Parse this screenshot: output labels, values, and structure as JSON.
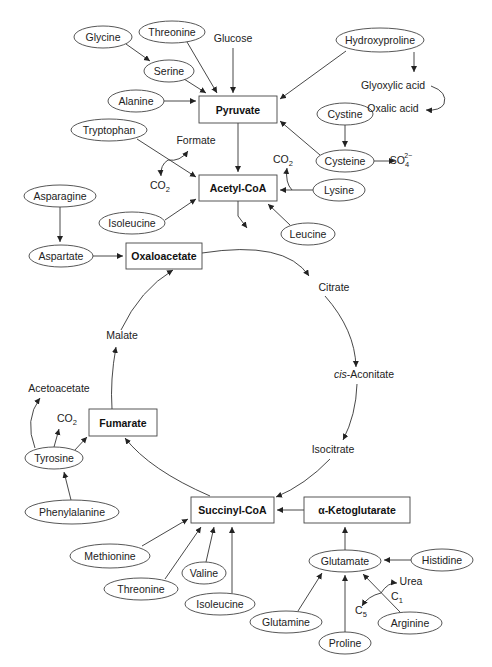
{
  "boxes": [
    {
      "id": "pyruvate",
      "label": "Pyruvate",
      "x": 199,
      "y": 96,
      "w": 78,
      "h": 27
    },
    {
      "id": "acetylcoa",
      "label": "Acetyl-CoA",
      "x": 199,
      "y": 175,
      "w": 78,
      "h": 26
    },
    {
      "id": "oxaloacetate",
      "label": "Oxaloacetate",
      "x": 126,
      "y": 243,
      "w": 76,
      "h": 26
    },
    {
      "id": "fumarate",
      "label": "Fumarate",
      "x": 89,
      "y": 409,
      "w": 68,
      "h": 27
    },
    {
      "id": "succinylcoa",
      "label": "Succinyl-CoA",
      "x": 191,
      "y": 497,
      "w": 83,
      "h": 26
    },
    {
      "id": "akg",
      "label": "α-Ketoglutarate",
      "x": 304,
      "y": 497,
      "w": 106,
      "h": 26
    }
  ],
  "ellipses": [
    {
      "id": "glycine",
      "label": "Glycine",
      "cx": 103,
      "cy": 37,
      "rx": 29,
      "ry": 11
    },
    {
      "id": "threonine-top",
      "label": "Threonine",
      "cx": 172,
      "cy": 32,
      "rx": 33,
      "ry": 11
    },
    {
      "id": "serine",
      "label": "Serine",
      "cx": 169,
      "cy": 71,
      "rx": 25,
      "ry": 11
    },
    {
      "id": "alanine",
      "label": "Alanine",
      "cx": 136,
      "cy": 101,
      "rx": 28,
      "ry": 11
    },
    {
      "id": "hydroxyproline",
      "label": "Hydroxyproline",
      "cx": 380,
      "cy": 40,
      "rx": 44,
      "ry": 12
    },
    {
      "id": "tryptophan",
      "label": "Tryptophan",
      "cx": 109,
      "cy": 130,
      "rx": 38,
      "ry": 11
    },
    {
      "id": "cystine",
      "label": "Cystine",
      "cx": 345,
      "cy": 114,
      "rx": 28,
      "ry": 11
    },
    {
      "id": "cysteine",
      "label": "Cysteine",
      "cx": 345,
      "cy": 161,
      "rx": 29,
      "ry": 11
    },
    {
      "id": "lysine",
      "label": "Lysine",
      "cx": 339,
      "cy": 190,
      "rx": 26,
      "ry": 11
    },
    {
      "id": "asparagine",
      "label": "Asparagine",
      "cx": 60,
      "cy": 196,
      "rx": 36,
      "ry": 11
    },
    {
      "id": "isoleucine-top",
      "label": "Isoleucine",
      "cx": 132,
      "cy": 223,
      "rx": 33,
      "ry": 11
    },
    {
      "id": "leucine",
      "label": "Leucine",
      "cx": 308,
      "cy": 234,
      "rx": 27,
      "ry": 11
    },
    {
      "id": "aspartate",
      "label": "Aspartate",
      "cx": 61,
      "cy": 256,
      "rx": 32,
      "ry": 11
    },
    {
      "id": "tyrosine",
      "label": "Tyrosine",
      "cx": 54,
      "cy": 458,
      "rx": 29,
      "ry": 11
    },
    {
      "id": "phenylalanine",
      "label": "Phenylalanine",
      "cx": 72,
      "cy": 512,
      "rx": 47,
      "ry": 12
    },
    {
      "id": "methionine",
      "label": "Methionine",
      "cx": 110,
      "cy": 556,
      "rx": 40,
      "ry": 12
    },
    {
      "id": "threonine-bottom",
      "label": "Threonine",
      "cx": 141,
      "cy": 589,
      "rx": 37,
      "ry": 11
    },
    {
      "id": "valine",
      "label": "Valine",
      "cx": 204,
      "cy": 573,
      "rx": 22,
      "ry": 11
    },
    {
      "id": "isoleucine-bottom",
      "label": "Isoleucine",
      "cx": 220,
      "cy": 604,
      "rx": 35,
      "ry": 11
    },
    {
      "id": "glutamate",
      "label": "Glutamate",
      "cx": 345,
      "cy": 561,
      "rx": 36,
      "ry": 11
    },
    {
      "id": "histidine",
      "label": "Histidine",
      "cx": 442,
      "cy": 560,
      "rx": 31,
      "ry": 11
    },
    {
      "id": "glutamine",
      "label": "Glutamine",
      "cx": 286,
      "cy": 622,
      "rx": 36,
      "ry": 11
    },
    {
      "id": "proline",
      "label": "Proline",
      "cx": 345,
      "cy": 643,
      "rx": 26,
      "ry": 11
    },
    {
      "id": "arginine",
      "label": "Arginine",
      "cx": 410,
      "cy": 623,
      "rx": 32,
      "ry": 11
    }
  ],
  "texts": [
    {
      "id": "glucose",
      "label": "Glucose",
      "x": 233,
      "y": 42
    },
    {
      "id": "glyoxylic-acid",
      "label": "Glyoxylic acid",
      "x": 393,
      "y": 89
    },
    {
      "id": "oxalic-acid",
      "label": "Oxalic acid",
      "x": 393,
      "y": 112
    },
    {
      "id": "formate",
      "label": "Formate",
      "x": 196,
      "y": 144
    },
    {
      "id": "co2-tryptophan",
      "label": "CO",
      "sub": "2",
      "x": 160,
      "y": 189
    },
    {
      "id": "co2-lysine",
      "label": "CO",
      "sub": "2",
      "x": 283,
      "y": 163
    },
    {
      "id": "sulfate",
      "label": "SO",
      "sub": "4",
      "sup": "2−",
      "x": 401,
      "y": 164
    },
    {
      "id": "citrate",
      "label": "Citrate",
      "x": 334,
      "y": 291
    },
    {
      "id": "cis-aconitate",
      "label": "-Aconitate",
      "italic_prefix": "cis",
      "x": 364,
      "y": 378
    },
    {
      "id": "isocitrate",
      "label": "Isocitrate",
      "x": 333,
      "y": 453
    },
    {
      "id": "malate",
      "label": "Malate",
      "x": 122,
      "y": 339
    },
    {
      "id": "acetoacetate",
      "label": "Acetoacetate",
      "x": 59,
      "y": 392
    },
    {
      "id": "co2-tyrosine",
      "label": "CO",
      "sub": "2",
      "x": 67,
      "y": 422
    },
    {
      "id": "urea",
      "label": "Urea",
      "x": 411,
      "y": 585
    },
    {
      "id": "c1",
      "label": "C",
      "sub": "1",
      "x": 397,
      "y": 600
    },
    {
      "id": "c5",
      "label": "C",
      "sub": "5",
      "x": 361,
      "y": 614
    }
  ]
}
